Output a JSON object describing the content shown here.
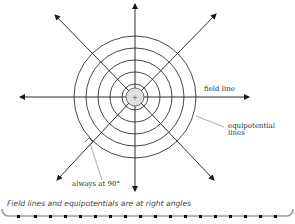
{
  "diagram": {
    "labels": {
      "field_line": "field line",
      "equipotential_line1": "equipotential",
      "equipotential_line2": "lines",
      "right_angle": "always at 90°"
    },
    "caption": "Field lines and equipotentials are at right angles",
    "charge_symbol": "+",
    "colors": {
      "lines": "#1a1a1a",
      "charge_fill": "#e0e0e0",
      "leader": "#777777",
      "border_dots": "#111111",
      "border_line": "#9a9a9a"
    },
    "center": [
      135,
      97
    ],
    "equipotential_radii": [
      13,
      25,
      37,
      49,
      61
    ],
    "charge_radius": 9
  }
}
